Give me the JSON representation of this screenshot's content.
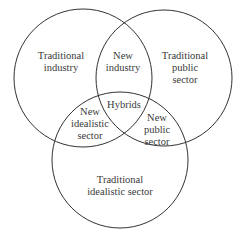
{
  "diagram": {
    "type": "venn",
    "circles": [
      {
        "name": "industry",
        "cx": 83,
        "cy": 78,
        "r": 69
      },
      {
        "name": "public-sector",
        "cx": 164,
        "cy": 78,
        "r": 68
      },
      {
        "name": "idealistic-sector",
        "cx": 120,
        "cy": 160,
        "r": 68
      }
    ],
    "stroke_color": "#333333",
    "regions": {
      "traditional_industry": {
        "line1": "Traditional",
        "line2": "industry"
      },
      "traditional_public": {
        "line1": "Traditional",
        "line2": "public",
        "line3": "sector"
      },
      "new_industry": {
        "line1": "New",
        "line2": "industry"
      },
      "hybrids": {
        "line1": "Hybrids"
      },
      "new_idealistic": {
        "line1": "New",
        "line2": "idealistic",
        "line3": "sector"
      },
      "new_public": {
        "line1": "New",
        "line2": "public",
        "line3": "sector"
      },
      "traditional_idealistic": {
        "line1": "Traditional",
        "line2": "idealistic sector"
      }
    }
  }
}
